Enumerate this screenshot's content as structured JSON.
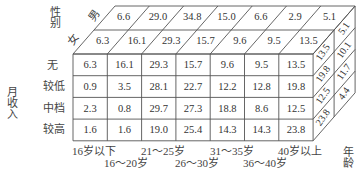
{
  "axes": {
    "gender_title": "性别",
    "income_title": "月收入",
    "age_title": "年龄",
    "gender": [
      "男",
      "女"
    ],
    "income": [
      "无",
      "较低",
      "中档",
      "较高"
    ],
    "age_top": [
      "16岁以下",
      "21～25岁",
      "31～35岁",
      "40岁以上"
    ],
    "age_bottom": [
      "16～20岁",
      "26～30岁",
      "36～40岁"
    ]
  },
  "chart_data": {
    "type": "table",
    "title": "",
    "age_groups": [
      "16岁以下",
      "16～20岁",
      "21～25岁",
      "26～30岁",
      "31～35岁",
      "36～40岁",
      "40岁以上"
    ],
    "gender_rows": {
      "男": [
        6.6,
        29.0,
        34.8,
        15.0,
        6.6,
        2.9,
        5.1
      ],
      "女": [
        6.3,
        16.1,
        29.3,
        15.7,
        9.6,
        9.5,
        13.5
      ]
    },
    "income_rows": {
      "无": [
        6.3,
        16.1,
        29.3,
        15.7,
        9.6,
        9.5,
        13.5
      ],
      "较低": [
        0.9,
        3.5,
        28.1,
        22.7,
        12.2,
        12.8,
        19.8
      ],
      "中档": [
        2.3,
        0.8,
        29.7,
        27.3,
        18.8,
        8.6,
        12.5
      ],
      "较高": [
        1.6,
        1.6,
        19.0,
        25.4,
        14.3,
        14.3,
        23.8
      ]
    },
    "side_face": {
      "front_column": [
        13.5,
        19.8,
        12.5,
        23.8
      ],
      "back_column": [
        5.1,
        10.1,
        11.7,
        4.4
      ]
    }
  },
  "top": {
    "row_male": [
      "6.6",
      "29.0",
      "34.8",
      "15.0",
      "6.6",
      "2.9",
      "5.1"
    ],
    "row_female": [
      "6.3",
      "16.1",
      "29.3",
      "15.7",
      "9.6",
      "9.5",
      "13.5"
    ]
  },
  "front": {
    "rows": [
      [
        "6.3",
        "16.1",
        "29.3",
        "15.7",
        "9.6",
        "9.5",
        "13.5"
      ],
      [
        "0.9",
        "3.5",
        "28.1",
        "22.7",
        "12.2",
        "12.8",
        "19.8"
      ],
      [
        "2.3",
        "0.8",
        "29.7",
        "27.3",
        "18.8",
        "8.6",
        "12.5"
      ],
      [
        "1.6",
        "1.6",
        "19.0",
        "25.4",
        "14.3",
        "14.3",
        "23.8"
      ]
    ]
  },
  "side": {
    "front_col": [
      "13.5",
      "19.8",
      "12.5",
      "23.8"
    ],
    "back_col": [
      "5.1",
      "10.1",
      "11.7",
      "4.4"
    ]
  }
}
